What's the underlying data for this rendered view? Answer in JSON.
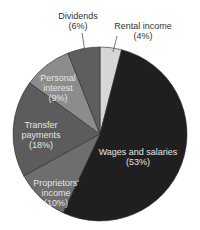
{
  "chart_data": {
    "type": "pie",
    "title": "",
    "start_angle_deg": 0,
    "direction": "clockwise",
    "center": [
      100,
      134
    ],
    "radius": 87,
    "categories": [
      "Rental income",
      "Wages and salaries",
      "Proprietors' income",
      "Transfer payments",
      "Personal interest",
      "Dividends"
    ],
    "values": [
      4,
      53,
      10,
      18,
      9,
      6
    ],
    "unit": "%",
    "colors": [
      "#d6d6d6",
      "#1f1f1f",
      "#6e6e6e",
      "#5c5c5c",
      "#8c8c8c",
      "#5e5e5e"
    ],
    "legend": "none (labels inline / with leader lines)"
  },
  "labels": [
    {
      "id": "rental",
      "lines": [
        "Rental income",
        "(4%)"
      ],
      "x": 143,
      "y": 21,
      "tone": "dark"
    },
    {
      "id": "wages",
      "lines": [
        "Wages and salaries",
        "(53%)"
      ],
      "x": 138,
      "y": 145,
      "tone": "light"
    },
    {
      "id": "proprietors",
      "lines": [
        "Proprietors'",
        "income",
        "(10%)"
      ],
      "x": 56,
      "y": 178,
      "tone": "light"
    },
    {
      "id": "transfer",
      "lines": [
        "Transfer",
        "payments",
        "(18%)"
      ],
      "x": 41,
      "y": 120,
      "tone": "light"
    },
    {
      "id": "interest",
      "lines": [
        "Personal",
        "interest",
        "(9%)"
      ],
      "x": 58,
      "y": 73,
      "tone": "light"
    },
    {
      "id": "dividends",
      "lines": [
        "Dividends",
        "(6%)"
      ],
      "x": 78,
      "y": 11,
      "tone": "dark"
    }
  ],
  "leaders": [
    {
      "id": "dividends-leader",
      "x1": 82,
      "y1": 33,
      "x2": 85,
      "y2": 52
    },
    {
      "id": "rental-leader",
      "x1": 117,
      "y1": 36,
      "x2": 113,
      "y2": 52
    }
  ]
}
